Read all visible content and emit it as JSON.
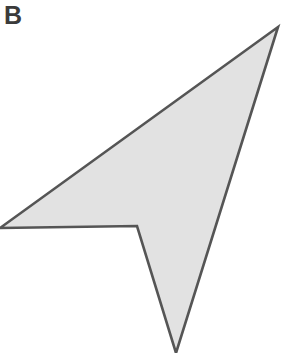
{
  "figure": {
    "panel_label": "B",
    "background_color": "#ffffff",
    "width": 288,
    "height": 353
  },
  "shape": {
    "name": "arrow-like-concave-polygon",
    "fill_color": "#e2e2e2",
    "stroke_color": "#555555",
    "stroke_width": 2.6,
    "vertex_count": 4,
    "vertices": [
      {
        "label": "left-tip",
        "x": 0,
        "y": 228
      },
      {
        "label": "top-right-apex",
        "x": 278,
        "y": 27
      },
      {
        "label": "bottom-tip",
        "x": 176,
        "y": 353
      },
      {
        "label": "notch-vertex",
        "x": 137,
        "y": 226
      }
    ],
    "points_attr": "0,228 278,27 176,353 137,226"
  }
}
